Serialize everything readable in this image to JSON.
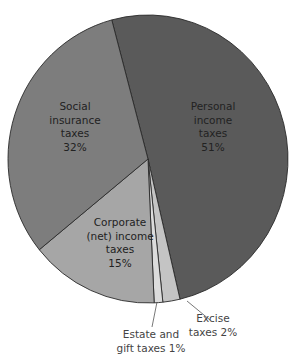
{
  "chart_data": {
    "type": "pie",
    "title": "",
    "slices": [
      {
        "name": "Personal income taxes",
        "value": 51,
        "label_lines": [
          "Personal",
          "income",
          "taxes",
          "51%"
        ],
        "color": "#5a5a5a"
      },
      {
        "name": "Excise taxes",
        "value": 2,
        "label_lines": [
          "Excise",
          "taxes 2%"
        ],
        "color": "#c4c4c4"
      },
      {
        "name": "Estate and gift taxes",
        "value": 1,
        "label_lines": [
          "Estate and",
          "gift taxes 1%"
        ],
        "color": "#dcdcdc"
      },
      {
        "name": "Corporate (net) income taxes",
        "value": 15,
        "label_lines": [
          "Corporate",
          "(net) income",
          "taxes",
          "15%"
        ],
        "color": "#a6a6a6"
      },
      {
        "name": "Social insurance taxes",
        "value": 32,
        "label_lines": [
          "Social",
          "insurance",
          "taxes",
          "32%"
        ],
        "color": "#7d7d7d"
      }
    ],
    "legend": "none (direct labels)",
    "start_angle_note": "Personal income slice starts near top (~-15deg from vertical) going clockwise"
  },
  "labels": {
    "personal": [
      "Personal",
      "income",
      "taxes",
      "51%"
    ],
    "social": [
      "Social",
      "insurance",
      "taxes",
      "32%"
    ],
    "corporate": [
      "Corporate",
      "(net) income",
      "taxes",
      "15%"
    ],
    "excise": [
      "Excise",
      "taxes 2%"
    ],
    "estate": [
      "Estate and",
      "gift taxes 1%"
    ]
  }
}
